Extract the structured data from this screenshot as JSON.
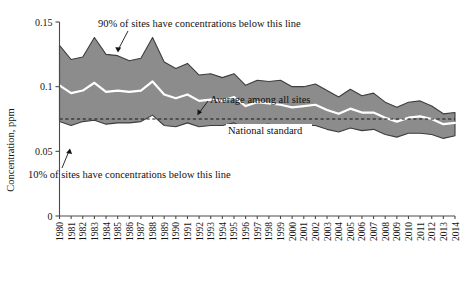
{
  "chart_data": {
    "type": "area",
    "title": "",
    "xlabel": "",
    "ylabel": "Concentration, ppm",
    "ylim": [
      0,
      0.15
    ],
    "yticks": [
      "0",
      "0.05",
      "0.1",
      "0.15"
    ],
    "ytick_values": [
      0,
      0.05,
      0.1,
      0.15
    ],
    "grid": false,
    "legend": "none",
    "categories": [
      "1980",
      "1981",
      "1982",
      "1983",
      "1984",
      "1985",
      "1986",
      "1987",
      "1988",
      "1989",
      "1990",
      "1991",
      "1992",
      "1993",
      "1994",
      "1995",
      "1996",
      "1997",
      "1998",
      "1999",
      "2000",
      "2001",
      "2002",
      "2003",
      "2004",
      "2005",
      "2006",
      "2007",
      "2008",
      "2009",
      "2010",
      "2011",
      "2012",
      "2013",
      "2014"
    ],
    "series": [
      {
        "name": "90th percentile",
        "annotation": "90% of sites have concentrations below this line",
        "values": [
          0.132,
          0.121,
          0.123,
          0.138,
          0.125,
          0.124,
          0.12,
          0.122,
          0.138,
          0.119,
          0.114,
          0.118,
          0.109,
          0.11,
          0.107,
          0.11,
          0.101,
          0.105,
          0.104,
          0.105,
          0.1,
          0.1,
          0.102,
          0.097,
          0.092,
          0.098,
          0.093,
          0.095,
          0.088,
          0.084,
          0.088,
          0.089,
          0.085,
          0.079,
          0.08
        ]
      },
      {
        "name": "Average among all sites",
        "annotation": "Average among all sites",
        "values": [
          0.101,
          0.095,
          0.097,
          0.103,
          0.096,
          0.097,
          0.096,
          0.097,
          0.104,
          0.094,
          0.091,
          0.094,
          0.089,
          0.09,
          0.089,
          0.092,
          0.085,
          0.088,
          0.087,
          0.086,
          0.084,
          0.085,
          0.086,
          0.082,
          0.079,
          0.083,
          0.08,
          0.08,
          0.076,
          0.073,
          0.076,
          0.077,
          0.075,
          0.071,
          0.072
        ]
      },
      {
        "name": "10th percentile",
        "annotation": "10% of sites have concentrations below this line",
        "values": [
          0.073,
          0.07,
          0.073,
          0.074,
          0.071,
          0.072,
          0.072,
          0.073,
          0.078,
          0.07,
          0.069,
          0.072,
          0.069,
          0.07,
          0.07,
          0.072,
          0.068,
          0.07,
          0.071,
          0.069,
          0.068,
          0.07,
          0.07,
          0.067,
          0.065,
          0.068,
          0.066,
          0.067,
          0.063,
          0.061,
          0.064,
          0.064,
          0.063,
          0.06,
          0.062
        ]
      }
    ],
    "reference_line": {
      "label": "National standard",
      "value": 0.075,
      "style": "dashed"
    },
    "annotations": [
      {
        "id": "p90",
        "text": "90% of sites have concentrations below this line"
      },
      {
        "id": "avg",
        "text": "Average among all sites"
      },
      {
        "id": "std",
        "text": "National standard"
      },
      {
        "id": "p10",
        "text": "10% of sites have concentrations below this line"
      }
    ],
    "colors": {
      "band_fill": "#8c8c8c",
      "band_stroke": "#3d3d3d",
      "average_line": "#ffffff",
      "reference_line": "#141414",
      "axis": "#4a4a4a",
      "text": "#161616",
      "background": "#ffffff"
    }
  }
}
